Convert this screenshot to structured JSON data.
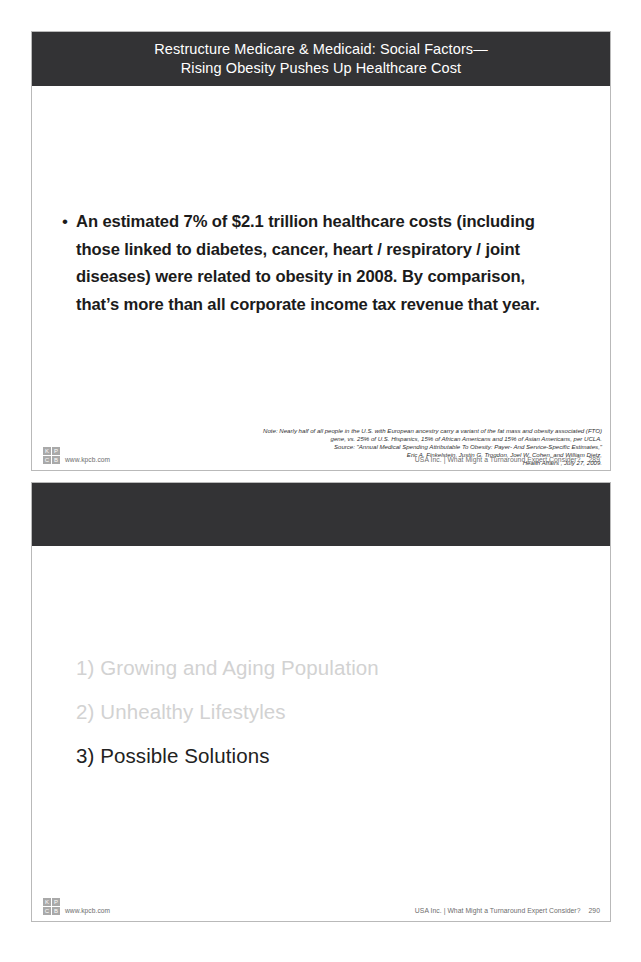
{
  "document": {
    "type": "presentation-slide-scan",
    "slide_count": 2
  },
  "slide1": {
    "title": "Restructure Medicare & Medicaid: Social Factors—\nRising Obesity Pushes Up Healthcare Cost",
    "bullet_marker": "•",
    "bullet_text": "An estimated 7% of $2.1 trillion healthcare costs (including those linked to diabetes, cancer, heart / respiratory / joint diseases) were related to obesity in 2008.  By comparison, that’s more than all corporate income tax revenue that year.",
    "footnote": [
      "Note: Nearly half of all people in the U.S. with European ancestry carry a variant of the fat mass and obesity associated (FTO)",
      "gene, vs. 25% of U.S. Hispanics, 15% of African Americans and 15% of Asian Americans, per UCLA.",
      "Source: \"Annual Medical Spending Attributable To Obesity: Payer- And Service-Specific Estimates,\"",
      "Eric A. Finkelstein, Justin G. Trogdon, Joel W. Cohen, and William Dietz,",
      "Health Affairs , July 27, 2009."
    ],
    "footer": {
      "logo_cells": [
        "K",
        "P",
        "C",
        "B"
      ],
      "url": "www.kpcb.com",
      "deck_title": "USA Inc. | What Might a Turnaround Expert Consider?",
      "page_number": "289"
    }
  },
  "slide2": {
    "title": "",
    "agenda": [
      {
        "label": "1) Growing and Aging Population",
        "state": "dim"
      },
      {
        "label": "2) Unhealthy Lifestyles",
        "state": "dim"
      },
      {
        "label": "3) Possible Solutions",
        "state": "active"
      }
    ],
    "footer": {
      "logo_cells": [
        "K",
        "P",
        "C",
        "B"
      ],
      "url": "www.kpcb.com",
      "deck_title": "USA Inc. | What Might a Turnaround Expert Consider?",
      "page_number": "290"
    }
  },
  "colors": {
    "title_bar": "#333335",
    "page_background": "#ffffff",
    "body_text": "#1b1b1b",
    "dim_text": "#d2d2d2",
    "footer_text": "#6d6d6d",
    "slide_border": "#b9b9b9"
  }
}
